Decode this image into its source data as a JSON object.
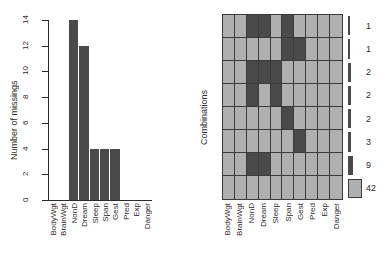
{
  "chart_data": [
    {
      "type": "bar",
      "title": "",
      "ylabel": "Number of missings",
      "xlabel": "",
      "categories": [
        "BodyWgt",
        "BrainWgt",
        "NonD",
        "Dream",
        "Sleep",
        "Span",
        "Gest",
        "Pred",
        "Exp",
        "Danger"
      ],
      "values": [
        0,
        0,
        14,
        12,
        4,
        4,
        4,
        0,
        0,
        0
      ],
      "ylim": [
        0,
        14
      ],
      "yticks": [
        0,
        2,
        4,
        6,
        8,
        10,
        12,
        14
      ],
      "grid": false,
      "legend": "none",
      "bar_color": "#4a4a4a"
    },
    {
      "type": "heatmap",
      "title": "",
      "ylabel": "Combinations",
      "xlabel": "",
      "categories": [
        "BodyWgt",
        "BrainWgt",
        "NonD",
        "Dream",
        "Sleep",
        "Span",
        "Gest",
        "Pred",
        "Exp",
        "Danger"
      ],
      "row_counts": [
        1,
        1,
        2,
        2,
        2,
        3,
        9,
        42
      ],
      "cell_states": [
        [
          "observed",
          "observed",
          "missing",
          "missing",
          "observed",
          "missing",
          "observed",
          "observed",
          "observed",
          "observed"
        ],
        [
          "observed",
          "observed",
          "observed",
          "observed",
          "observed",
          "missing",
          "missing",
          "observed",
          "observed",
          "observed"
        ],
        [
          "observed",
          "observed",
          "missing",
          "missing",
          "missing",
          "observed",
          "observed",
          "observed",
          "observed",
          "observed"
        ],
        [
          "observed",
          "observed",
          "missing",
          "observed",
          "missing",
          "observed",
          "observed",
          "observed",
          "observed",
          "observed"
        ],
        [
          "observed",
          "observed",
          "observed",
          "observed",
          "observed",
          "missing",
          "observed",
          "observed",
          "observed",
          "observed"
        ],
        [
          "observed",
          "observed",
          "observed",
          "observed",
          "observed",
          "observed",
          "missing",
          "observed",
          "observed",
          "observed"
        ],
        [
          "observed",
          "observed",
          "missing",
          "missing",
          "observed",
          "observed",
          "observed",
          "observed",
          "observed",
          "observed"
        ],
        [
          "observed",
          "observed",
          "observed",
          "observed",
          "observed",
          "observed",
          "observed",
          "observed",
          "observed",
          "observed"
        ]
      ],
      "colors": {
        "missing": "#4a4a4a",
        "observed": "#b0b0b0",
        "border": "#3a3a3a"
      },
      "legend": "right"
    }
  ],
  "bar_panel": {
    "y_axis_title": "Number of missings",
    "y_tick_labels": [
      "0",
      "2",
      "4",
      "6",
      "8",
      "10",
      "12",
      "14"
    ],
    "x_tick_labels": [
      "BodyWgt",
      "BrainWgt",
      "NonD",
      "Dream",
      "Sleep",
      "Span",
      "Gest",
      "Pred",
      "Exp",
      "Danger"
    ]
  },
  "matrix_panel": {
    "y_axis_title": "Combinations",
    "x_tick_labels": [
      "BodyWgt",
      "BrainWgt",
      "NonD",
      "Dream",
      "Sleep",
      "Span",
      "Gest",
      "Pred",
      "Exp",
      "Danger"
    ],
    "frequency_labels": [
      "1",
      "1",
      "2",
      "2",
      "2",
      "3",
      "9",
      "42"
    ]
  }
}
